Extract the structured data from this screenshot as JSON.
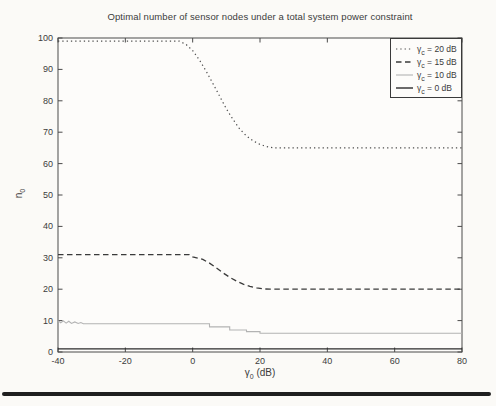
{
  "page": {
    "background": "#fbfaf7",
    "bottom_rule_color": "#1f1f1f"
  },
  "chart_data": {
    "type": "line",
    "title": "Optimal number of sensor nodes under a total system power constraint",
    "xlabel": "γ_0 (dB)",
    "ylabel": "n_0",
    "xlim": [
      -40,
      80
    ],
    "ylim": [
      0,
      100
    ],
    "x_ticks": [
      -40,
      -20,
      0,
      20,
      40,
      60,
      80
    ],
    "y_ticks": [
      0,
      10,
      20,
      30,
      40,
      50,
      60,
      70,
      80,
      90,
      100
    ],
    "grid": false,
    "legend_position": "top-right",
    "axis_color": "#4a4a4a",
    "tick_label_color": "#3c3c3c",
    "plot_bg": "#fdfcfa",
    "series": [
      {
        "name": "γ_c = 20 dB",
        "style": "dotted",
        "color": "#4d4d4d",
        "width": 1.2,
        "points": [
          [
            -40,
            99
          ],
          [
            -4,
            99
          ],
          [
            -2,
            98
          ],
          [
            0,
            96
          ],
          [
            2,
            93
          ],
          [
            4,
            89.5
          ],
          [
            6,
            85.5
          ],
          [
            8,
            81.5
          ],
          [
            10,
            77.5
          ],
          [
            12,
            74
          ],
          [
            14,
            71
          ],
          [
            16,
            68.8
          ],
          [
            18,
            67.2
          ],
          [
            20,
            66.1
          ],
          [
            22,
            65.4
          ],
          [
            24,
            65
          ],
          [
            80,
            65
          ]
        ]
      },
      {
        "name": "γ_c = 15 dB",
        "style": "dashed",
        "color": "#3a3a3a",
        "width": 1.3,
        "points": [
          [
            -40,
            31
          ],
          [
            -1,
            31
          ],
          [
            0,
            30.3
          ],
          [
            3,
            29.5
          ],
          [
            5,
            28.3
          ],
          [
            7,
            26.8
          ],
          [
            9,
            25.2
          ],
          [
            11,
            23.8
          ],
          [
            13,
            22.6
          ],
          [
            15,
            21.6
          ],
          [
            17,
            20.9
          ],
          [
            19,
            20.4
          ],
          [
            21,
            20.1
          ],
          [
            23,
            20
          ],
          [
            80,
            20
          ]
        ]
      },
      {
        "name": "γ_c = 10 dB",
        "style": "solid",
        "color": "#b3b3b3",
        "width": 1.1,
        "points": [
          [
            -40,
            10
          ],
          [
            -39.2,
            9.3
          ],
          [
            -38.4,
            9.9
          ],
          [
            -37.6,
            9.2
          ],
          [
            -36.8,
            9.8
          ],
          [
            -36,
            9.1
          ],
          [
            -35,
            9.6
          ],
          [
            -34,
            9.1
          ],
          [
            -33.2,
            9.4
          ],
          [
            -32.5,
            9
          ],
          [
            5,
            9
          ],
          [
            5,
            8
          ],
          [
            11,
            8
          ],
          [
            11,
            7
          ],
          [
            16,
            7
          ],
          [
            16,
            6.5
          ],
          [
            20,
            6.5
          ],
          [
            20,
            6
          ],
          [
            80,
            6
          ]
        ]
      },
      {
        "name": "γ_c = 0 dB",
        "style": "solid",
        "color": "#2b2b2b",
        "width": 1.4,
        "points": [
          [
            -40,
            1
          ],
          [
            80,
            1
          ]
        ]
      }
    ]
  }
}
